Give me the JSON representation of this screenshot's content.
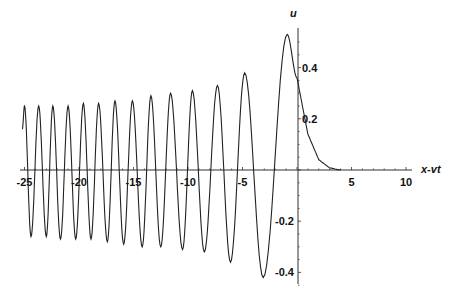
{
  "chart_data": {
    "type": "line",
    "title": "",
    "xlabel": "x-vt",
    "ylabel": "u",
    "xlim": [
      -25.2,
      11
    ],
    "ylim": [
      -0.45,
      0.55
    ],
    "grid": false,
    "legend": null,
    "x_ticks": [
      -25,
      -20,
      -15,
      -10,
      -5,
      5,
      10
    ],
    "x_tick_labels": [
      "-25",
      "-20",
      "-15",
      "-10",
      "-5",
      "5",
      "10"
    ],
    "y_ticks": [
      0.4,
      0.2,
      -0.2,
      -0.4
    ],
    "y_tick_labels": [
      "0.4",
      "0.2",
      "-0.2",
      "-0.4"
    ],
    "series": [
      {
        "name": "u(x-vt)",
        "color": "#222222",
        "extrema": [
          {
            "x": -25.2,
            "u": 0.16
          },
          {
            "x": -25.0,
            "u": 0.25
          },
          {
            "x": -24.4,
            "u": -0.26
          },
          {
            "x": -23.7,
            "u": 0.25
          },
          {
            "x": -23.0,
            "u": -0.26
          },
          {
            "x": -22.4,
            "u": 0.25
          },
          {
            "x": -21.7,
            "u": -0.27
          },
          {
            "x": -21.0,
            "u": 0.25
          },
          {
            "x": -20.3,
            "u": -0.27
          },
          {
            "x": -19.6,
            "u": 0.26
          },
          {
            "x": -18.9,
            "u": -0.27
          },
          {
            "x": -18.2,
            "u": 0.26
          },
          {
            "x": -17.4,
            "u": -0.28
          },
          {
            "x": -16.7,
            "u": 0.27
          },
          {
            "x": -15.9,
            "u": -0.29
          },
          {
            "x": -15.1,
            "u": 0.27
          },
          {
            "x": -14.2,
            "u": -0.3
          },
          {
            "x": -13.4,
            "u": 0.29
          },
          {
            "x": -12.5,
            "u": -0.3
          },
          {
            "x": -11.6,
            "u": 0.3
          },
          {
            "x": -10.5,
            "u": -0.31
          },
          {
            "x": -9.6,
            "u": 0.31
          },
          {
            "x": -8.5,
            "u": -0.32
          },
          {
            "x": -7.3,
            "u": 0.33
          },
          {
            "x": -6.1,
            "u": -0.36
          },
          {
            "x": -4.8,
            "u": 0.38
          },
          {
            "x": -3.1,
            "u": -0.42
          },
          {
            "x": -0.9,
            "u": 0.53
          },
          {
            "x": 0.0,
            "u": 0.36
          },
          {
            "x": 1.0,
            "u": 0.14
          },
          {
            "x": 2.0,
            "u": 0.04
          },
          {
            "x": 3.0,
            "u": 0.008
          },
          {
            "x": 4.0,
            "u": 0.0
          }
        ]
      }
    ]
  }
}
